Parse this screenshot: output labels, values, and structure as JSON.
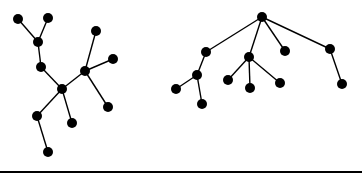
{
  "colors": {
    "background": "#ffffff",
    "ink": "#000000"
  },
  "node_radius": 5,
  "trees": [
    {
      "name": "left-tree",
      "nodes": [
        {
          "id": "a",
          "x": 18,
          "y": 19
        },
        {
          "id": "b",
          "x": 48,
          "y": 18
        },
        {
          "id": "c",
          "x": 38,
          "y": 42
        },
        {
          "id": "d",
          "x": 41,
          "y": 67
        },
        {
          "id": "e",
          "x": 62,
          "y": 89
        },
        {
          "id": "f",
          "x": 85,
          "y": 71
        },
        {
          "id": "g",
          "x": 96,
          "y": 31
        },
        {
          "id": "h",
          "x": 113,
          "y": 59
        },
        {
          "id": "i",
          "x": 108,
          "y": 107
        },
        {
          "id": "j",
          "x": 37,
          "y": 116
        },
        {
          "id": "k",
          "x": 72,
          "y": 123
        },
        {
          "id": "l",
          "x": 48,
          "y": 152
        }
      ],
      "edges": [
        [
          "a",
          "c"
        ],
        [
          "b",
          "c"
        ],
        [
          "c",
          "d"
        ],
        [
          "d",
          "e"
        ],
        [
          "e",
          "f"
        ],
        [
          "f",
          "g"
        ],
        [
          "f",
          "h"
        ],
        [
          "f",
          "i"
        ],
        [
          "e",
          "j"
        ],
        [
          "e",
          "k"
        ],
        [
          "j",
          "l"
        ]
      ]
    },
    {
      "name": "right-tree",
      "nodes": [
        {
          "id": "r",
          "x": 262,
          "y": 17
        },
        {
          "id": "s",
          "x": 206,
          "y": 52
        },
        {
          "id": "t",
          "x": 249,
          "y": 57
        },
        {
          "id": "u",
          "x": 285,
          "y": 51
        },
        {
          "id": "v",
          "x": 330,
          "y": 49
        },
        {
          "id": "w",
          "x": 197,
          "y": 75
        },
        {
          "id": "x",
          "x": 176,
          "y": 89
        },
        {
          "id": "y",
          "x": 202,
          "y": 104
        },
        {
          "id": "z",
          "x": 228,
          "y": 80
        },
        {
          "id": "aa",
          "x": 250,
          "y": 88
        },
        {
          "id": "ab",
          "x": 280,
          "y": 83
        },
        {
          "id": "ac",
          "x": 342,
          "y": 84
        }
      ],
      "edges": [
        [
          "r",
          "s"
        ],
        [
          "r",
          "t"
        ],
        [
          "r",
          "u"
        ],
        [
          "r",
          "v"
        ],
        [
          "s",
          "w"
        ],
        [
          "w",
          "x"
        ],
        [
          "w",
          "y"
        ],
        [
          "t",
          "z"
        ],
        [
          "t",
          "aa"
        ],
        [
          "t",
          "ab"
        ],
        [
          "v",
          "ac"
        ]
      ]
    }
  ],
  "baseline": {
    "x1": 0,
    "x2": 362,
    "y": 172,
    "thickness": 2
  }
}
